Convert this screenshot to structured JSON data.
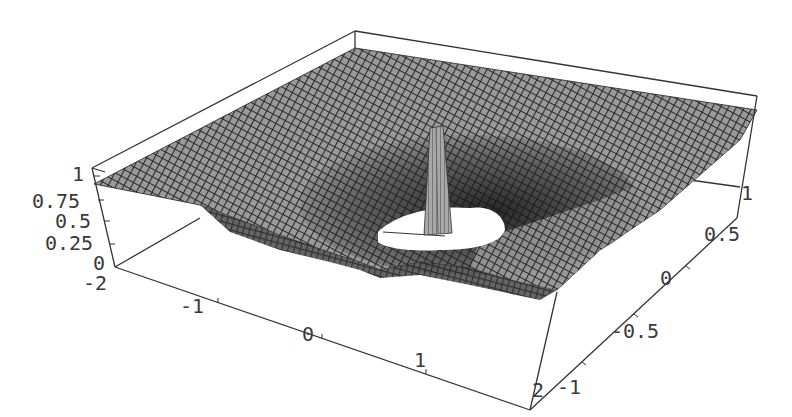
{
  "chart_data": {
    "type": "surface3d",
    "title": "",
    "x_axis": {
      "label": "",
      "range": [
        -2,
        2
      ],
      "ticks": [
        "-2",
        "-1",
        "0",
        "1",
        "2"
      ]
    },
    "y_axis": {
      "label": "",
      "range": [
        -1,
        1
      ],
      "ticks": [
        "-1",
        "-0.5",
        "0",
        "0.5",
        "1"
      ]
    },
    "z_axis": {
      "label": "",
      "range": [
        0,
        1
      ],
      "ticks": [
        "0",
        "0.25",
        "0.5",
        "0.75",
        "1"
      ]
    },
    "mesh": true,
    "box": true,
    "shading": "grayscale"
  },
  "axes": {
    "z_ticks": [
      {
        "label": "1",
        "x": 72,
        "y": 181
      },
      {
        "label": "0.75",
        "x": 32,
        "y": 208
      },
      {
        "label": "0.5",
        "x": 55,
        "y": 228
      },
      {
        "label": "0.25",
        "x": 45,
        "y": 250
      },
      {
        "label": "0",
        "x": 93,
        "y": 270
      }
    ],
    "x_ticks": [
      {
        "label": "-2",
        "x": 83,
        "y": 290
      },
      {
        "label": "-1",
        "x": 180,
        "y": 313
      },
      {
        "label": "0",
        "x": 302,
        "y": 341
      },
      {
        "label": "1",
        "x": 414,
        "y": 367
      },
      {
        "label": "2",
        "x": 532,
        "y": 397
      }
    ],
    "y_ticks": [
      {
        "label": "-1",
        "x": 557,
        "y": 394
      },
      {
        "label": "-0.5",
        "x": 611,
        "y": 338
      },
      {
        "label": "0",
        "x": 660,
        "y": 285
      },
      {
        "label": "0.5",
        "x": 704,
        "y": 241
      },
      {
        "label": "1",
        "x": 741,
        "y": 200
      }
    ]
  }
}
